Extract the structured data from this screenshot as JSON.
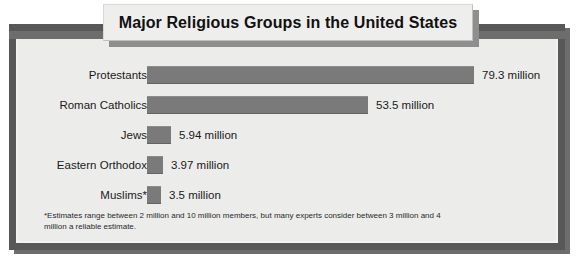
{
  "title": "Major Religious Groups  in the United States",
  "footnote": "*Estimates range between 2 million and 10 million members, but many experts consider between 3 million and 4 million a reliable estimate.",
  "colors": {
    "bar": "#7a7a7a",
    "panel_background": "#ececeb",
    "panel_border": "#585858",
    "title_background": "#eeeeec",
    "shadow": "#6d6d6d",
    "text": "#1a1a1a"
  },
  "chart_data": {
    "type": "bar",
    "orientation": "horizontal",
    "title": "Major Religious Groups  in the United States",
    "xlabel": "",
    "ylabel": "",
    "unit": "million",
    "grid": false,
    "legend": "none",
    "xlim": [
      0,
      79.3
    ],
    "categories": [
      "Protestants",
      "Roman Catholics",
      "Jews",
      "Eastern Orthodox",
      "Muslims*"
    ],
    "values": [
      79.3,
      53.5,
      5.94,
      3.97,
      3.5
    ],
    "value_labels": [
      "79.3 million",
      "53.5 million",
      "5.94 million",
      "3.97 million",
      "3.5 million"
    ],
    "annotations": [
      "*Estimates range between 2 million and 10 million members, but many experts consider between 3 million and 4 million a reliable estimate."
    ]
  }
}
